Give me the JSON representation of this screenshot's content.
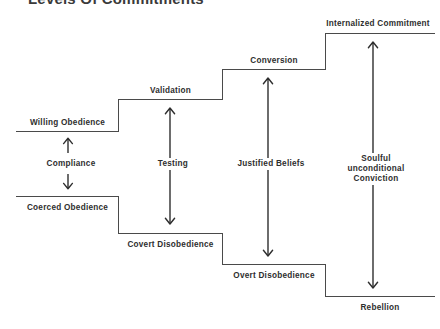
{
  "diagram": {
    "title": "Levels Of Commitments",
    "stroke_color": "#4a4a4a",
    "text_color": "#2e2e2e",
    "background_color": "#ffffff"
  },
  "steps": {
    "upper": [
      {
        "label": "Willing Obedience"
      },
      {
        "label": "Validation"
      },
      {
        "label": "Conversion"
      },
      {
        "label": "Internalized Commitment"
      }
    ],
    "lower": [
      {
        "label": "Coerced Obedience"
      },
      {
        "label": "Covert Disobedience"
      },
      {
        "label": "Overt Disobedience"
      },
      {
        "label": "Rebellion"
      }
    ]
  },
  "transitions": [
    {
      "label": "Compliance",
      "style": "split-arrows"
    },
    {
      "label": "Testing",
      "style": "double-headed"
    },
    {
      "label": "Justified Beliefs",
      "style": "double-headed"
    },
    {
      "label": "Soulful unconditional Conviction",
      "style": "double-headed"
    }
  ]
}
